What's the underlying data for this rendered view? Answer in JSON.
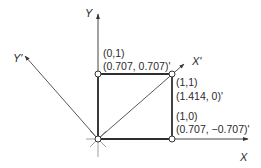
{
  "diagram": {
    "title": "",
    "axes": {
      "x": "X",
      "y": "Y",
      "x_prime": "X'",
      "y_prime": "Y'"
    },
    "points": [
      {
        "id": "p01",
        "orig": "(0,1)",
        "rotated": "(0.707, 0.707)'"
      },
      {
        "id": "p11",
        "orig": "(1,1)",
        "rotated": "(1.414, 0)'"
      },
      {
        "id": "p10",
        "orig": "(1,0)",
        "rotated": "(0.707, −0.707)'"
      }
    ],
    "colors": {
      "line": "#3a3a3a",
      "square": "#2e2e2e",
      "point_fill": "#ffffff"
    }
  }
}
